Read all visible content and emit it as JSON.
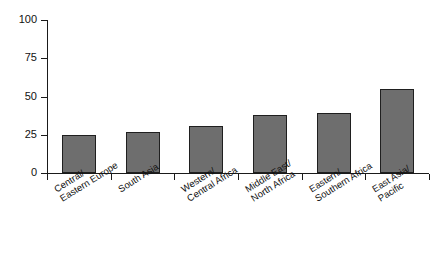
{
  "chart_data": {
    "type": "bar",
    "title": "",
    "subtitle": "",
    "xlabel": "",
    "ylabel": "",
    "categories": [
      "Central/\nEastern Europe",
      "South Asia",
      "Western/\nCentral Africa",
      "Middle East/\nNorth Africa",
      "Eastern/\nSouthern Africa",
      "East Asia/\nPacific"
    ],
    "category_lines": [
      [
        "Central/",
        "Eastern Europe"
      ],
      [
        "South Asia",
        ""
      ],
      [
        "Western/",
        "Central Africa"
      ],
      [
        "Middle East/",
        "North Africa"
      ],
      [
        "Eastern/",
        "Southern Africa"
      ],
      [
        "East Asia/",
        "Pacific"
      ]
    ],
    "values": [
      25,
      27,
      31,
      38,
      39,
      55
    ],
    "ylim": [
      0,
      100
    ],
    "yticks": [
      0,
      25,
      50,
      75,
      100
    ],
    "ytick_labels": [
      "0",
      "25",
      "50",
      "75",
      "100"
    ],
    "grid": false,
    "legend": null,
    "legend_position": "none",
    "bar_color": "#6e6e6e",
    "bar_edge_color": "#1f1f1f",
    "axis_color": "#1a1a1a",
    "background_color": "#ffffff"
  }
}
